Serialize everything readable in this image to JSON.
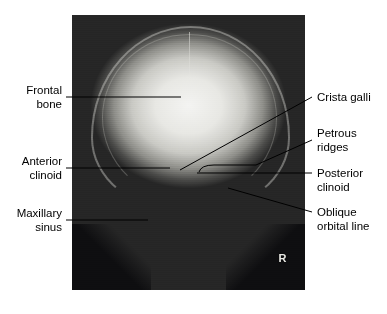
{
  "figure": {
    "type": "annotated-radiograph",
    "view": "Caldwell (PA) skull radiograph",
    "side_marker": "R",
    "caption": ""
  },
  "labels_left": [
    {
      "name": "frontal-bone",
      "line1": "Frontal",
      "line2": "bone"
    },
    {
      "name": "anterior-clinoid",
      "line1": "Anterior",
      "line2": "clinoid"
    },
    {
      "name": "maxillary-sinus",
      "line1": "Maxillary",
      "line2": "sinus"
    }
  ],
  "labels_right": [
    {
      "name": "crista-galli",
      "line1": "Crista galli",
      "line2": ""
    },
    {
      "name": "petrous-ridges",
      "line1": "Petrous",
      "line2": "ridges"
    },
    {
      "name": "posterior-clinoid",
      "line1": "Posterior",
      "line2": "clinoid"
    },
    {
      "name": "oblique-orbital-line",
      "line1": "Oblique",
      "line2": "orbital line"
    }
  ],
  "colors": {
    "leader": "#000000",
    "text": "#000000",
    "background": "#ffffff",
    "film_dark": "#1e1e20",
    "film_bright": "#f4f4f2"
  }
}
